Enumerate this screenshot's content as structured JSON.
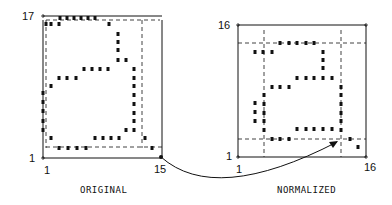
{
  "panels": [
    {
      "id": "original",
      "caption": "ORIGINAL",
      "y_top_label": "17",
      "y_bottom_label": "1",
      "x_left_label": "1",
      "x_right_label": "15"
    },
    {
      "id": "normalized",
      "caption": "NORMALIZED",
      "y_top_label": "16",
      "y_bottom_label": "1",
      "x_left_label": "1",
      "x_right_label": "16"
    }
  ],
  "colors": {
    "ink": "#111111",
    "background": "#ffffff"
  },
  "original_dots": [
    [
      60,
      18
    ],
    [
      67,
      18
    ],
    [
      74,
      18
    ],
    [
      81,
      18
    ],
    [
      88,
      18
    ],
    [
      95,
      18
    ],
    [
      46,
      24
    ],
    [
      51,
      24
    ],
    [
      59,
      24
    ],
    [
      109,
      24
    ],
    [
      118,
      34
    ],
    [
      118,
      42
    ],
    [
      118,
      50
    ],
    [
      118,
      60
    ],
    [
      126,
      60
    ],
    [
      84,
      69
    ],
    [
      92,
      69
    ],
    [
      100,
      69
    ],
    [
      108,
      69
    ],
    [
      59,
      78
    ],
    [
      67,
      78
    ],
    [
      76,
      78
    ],
    [
      134,
      69
    ],
    [
      134,
      78
    ],
    [
      51,
      86
    ],
    [
      134,
      86
    ],
    [
      134,
      95
    ],
    [
      43,
      93
    ],
    [
      43,
      102
    ],
    [
      43,
      111
    ],
    [
      43,
      121
    ],
    [
      43,
      130
    ],
    [
      134,
      104
    ],
    [
      134,
      113
    ],
    [
      134,
      121
    ],
    [
      126,
      130
    ],
    [
      134,
      130
    ],
    [
      51,
      138
    ],
    [
      95,
      138
    ],
    [
      103,
      138
    ],
    [
      111,
      138
    ],
    [
      119,
      138
    ],
    [
      145,
      138
    ],
    [
      59,
      148
    ],
    [
      68,
      148
    ],
    [
      77,
      148
    ],
    [
      86,
      148
    ],
    [
      152,
      148
    ]
  ],
  "normalized_dots": [
    [
      280,
      43
    ],
    [
      289,
      43
    ],
    [
      297,
      43
    ],
    [
      306,
      43
    ],
    [
      314,
      43
    ],
    [
      255,
      52
    ],
    [
      263,
      52
    ],
    [
      272,
      52
    ],
    [
      323,
      52
    ],
    [
      323,
      60
    ],
    [
      323,
      68
    ],
    [
      297,
      78
    ],
    [
      306,
      78
    ],
    [
      314,
      78
    ],
    [
      323,
      78
    ],
    [
      332,
      78
    ],
    [
      272,
      87
    ],
    [
      280,
      87
    ],
    [
      289,
      87
    ],
    [
      341,
      87
    ],
    [
      264,
      95
    ],
    [
      341,
      95
    ],
    [
      341,
      104
    ],
    [
      255,
      103
    ],
    [
      255,
      112
    ],
    [
      255,
      121
    ],
    [
      264,
      104
    ],
    [
      264,
      113
    ],
    [
      264,
      121
    ],
    [
      341,
      113
    ],
    [
      341,
      121
    ],
    [
      297,
      129
    ],
    [
      306,
      129
    ],
    [
      314,
      129
    ],
    [
      323,
      129
    ],
    [
      332,
      129
    ],
    [
      264,
      130
    ],
    [
      341,
      130
    ],
    [
      272,
      139
    ],
    [
      280,
      139
    ],
    [
      289,
      139
    ],
    [
      350,
      139
    ],
    [
      358,
      147
    ]
  ]
}
